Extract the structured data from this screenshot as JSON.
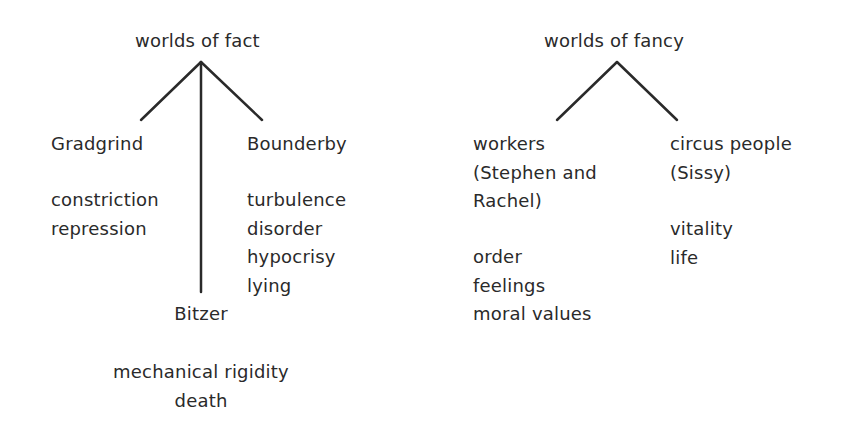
{
  "diagram": {
    "fact_tree": {
      "root": "worlds of fact",
      "children": [
        {
          "name": "Gradgrind",
          "traits": [
            "constriction",
            "repression"
          ]
        },
        {
          "name": "Bitzer",
          "traits": [
            "mechanical rigidity",
            "death"
          ]
        },
        {
          "name": "Bounderby",
          "traits": [
            "turbulence",
            "disorder",
            "hypocrisy",
            "lying"
          ]
        }
      ]
    },
    "fancy_tree": {
      "root": "worlds of fancy",
      "children": [
        {
          "name_lines": [
            "workers",
            "(Stephen and",
            "Rachel)"
          ],
          "traits": [
            "order",
            "feelings",
            "moral values"
          ]
        },
        {
          "name_lines": [
            "circus people",
            "(Sissy)"
          ],
          "traits": [
            "vitality",
            "life"
          ]
        }
      ]
    },
    "line_color": "#2a2a2a",
    "text_color": "#2a2a2a"
  }
}
